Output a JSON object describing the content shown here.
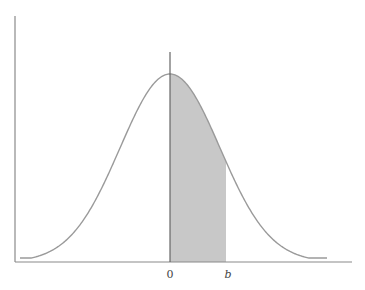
{
  "figure": {
    "colors": {
      "curve": "#9a9a9a",
      "axis": "#8a8a8a",
      "mean_line": "#666666",
      "shade": "#c8c8c8",
      "label": "#444444"
    },
    "labels": {
      "zero": "0",
      "b": "b"
    }
  },
  "chart_data": {
    "type": "area",
    "title": "",
    "xlabel": "",
    "ylabel": "",
    "curve": "normal density, mean 0",
    "tick_labels": [
      "0",
      "b"
    ],
    "shaded_region": {
      "from": "0",
      "to": "b"
    },
    "mean_line_at": "0",
    "grid": false,
    "legend": null
  }
}
